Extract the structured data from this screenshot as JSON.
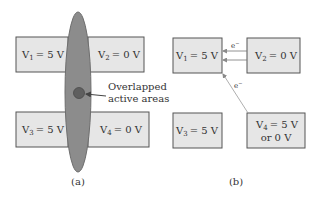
{
  "colors": {
    "box_fill": "#e6e6e6",
    "box_stroke": "#555555",
    "ellipse_fill": "#8c8c8c",
    "ellipse_stroke": "#6e6e6e",
    "overlap_fill": "#5f5f5f",
    "arrow": "#555555",
    "faint_arrow": "#9a9a9a",
    "text": "#333333"
  },
  "panel_a": {
    "caption": "(a)",
    "boxes": [
      {
        "var": "V",
        "sub": "1",
        "value": "= 5 V"
      },
      {
        "var": "V",
        "sub": "2",
        "value": "= 0 V"
      },
      {
        "var": "V",
        "sub": "3",
        "value": "= 5 V"
      },
      {
        "var": "V",
        "sub": "4",
        "value": "= 0 V"
      }
    ],
    "annotation": {
      "line1": "Overlapped",
      "line2": "active areas"
    }
  },
  "panel_b": {
    "caption": "(b)",
    "boxes": [
      {
        "var": "V",
        "sub": "1",
        "value": "= 5 V"
      },
      {
        "var": "V",
        "sub": "2",
        "value": "= 0 V"
      },
      {
        "var": "V",
        "sub": "3",
        "value": "= 5 V"
      },
      {
        "var": "V",
        "sub": "4",
        "value": "= 5 V",
        "value2": "or 0 V"
      }
    ],
    "electron_label": "e",
    "electron_sup": "−"
  }
}
